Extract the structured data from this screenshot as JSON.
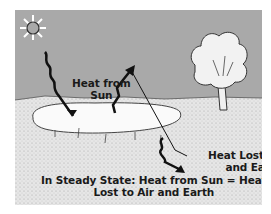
{
  "diagram": {
    "labels": {
      "heat_from_sun_line1": "Heat from",
      "heat_from_sun_line2": "Sun",
      "heat_lost_line1": "Heat Lost to Air",
      "heat_lost_line2": "and Earth",
      "steady_state_line1": "In Steady State: Heat from Sun = Heat",
      "steady_state_line2": "Lost to Air and Earth"
    },
    "elements": [
      "sun-icon",
      "pond",
      "tree",
      "ground",
      "sky",
      "incoming-heat-arrow",
      "outgoing-heat-arrow-air",
      "outgoing-heat-arrow-earth"
    ],
    "colors": {
      "sky": "#a9a9a9",
      "ground": "#e4e4e4",
      "pond": "#fafafa",
      "ink": "#1a1a1a"
    }
  }
}
